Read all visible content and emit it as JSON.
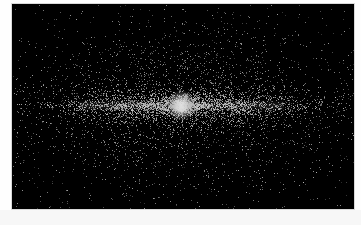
{
  "image": {
    "subject": "edge-on disk galaxy particle simulation",
    "background_color": "#000000",
    "frame_color": "#fefefe",
    "panel": {
      "x": 12,
      "y": 4,
      "width": 342,
      "height": 205
    },
    "core": {
      "cx": 0.495,
      "cy": 0.495,
      "radius": 7,
      "color": "#e8e8e8"
    },
    "particle_color": "#c8c8c8",
    "halo": {
      "count": 2600,
      "sigma_x": 0.26,
      "sigma_y": 0.22
    },
    "disk": {
      "count": 2200,
      "sigma_x": 0.2,
      "sigma_y": 0.045
    },
    "thin_disk": {
      "count": 900,
      "sigma_x": 0.16,
      "sigma_y": 0.012
    },
    "bulge": {
      "count": 500,
      "sigma_x": 0.03,
      "sigma_y": 0.025
    },
    "seed": 42
  }
}
